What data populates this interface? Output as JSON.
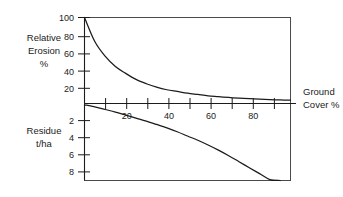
{
  "chart_data": {
    "type": "line",
    "title": "",
    "subtitle": "",
    "xlabel": "Ground Cover %",
    "xlim": [
      0,
      100
    ],
    "grid": false,
    "legend": "none",
    "x_ticks_major": [
      20,
      40,
      60,
      80
    ],
    "x_ticks_minor": [
      10,
      30,
      50,
      70,
      90
    ],
    "x_tick_labels": [
      "20",
      "40",
      "60",
      "80"
    ],
    "axes": [
      {
        "name": "relative-erosion",
        "label": "Relative Erosion %",
        "label_lines": [
          "Relative",
          "Erosion",
          "%"
        ],
        "position": "left-upper",
        "unit": "%",
        "ylim": [
          0,
          100
        ],
        "direction": "up-from-baseline",
        "ticks": [
          100,
          80,
          60,
          40,
          20
        ],
        "tick_labels": [
          "100",
          "80",
          "60",
          "40",
          "20"
        ]
      },
      {
        "name": "residue",
        "label": "Residue t/ha",
        "label_lines": [
          "Residue",
          "t/ha"
        ],
        "position": "left-lower",
        "unit": "t/ha",
        "ylim": [
          0,
          9
        ],
        "direction": "down-from-baseline",
        "ticks": [
          2,
          4,
          6,
          8
        ],
        "tick_labels": [
          "2",
          "4",
          "6",
          "8"
        ]
      }
    ],
    "series": [
      {
        "name": "Relative Erosion %",
        "axis": "relative-erosion",
        "x": [
          0,
          5,
          10,
          15,
          20,
          25,
          30,
          35,
          40,
          45,
          50,
          55,
          60,
          65,
          70,
          75,
          80,
          85,
          90,
          95,
          100
        ],
        "values": [
          100,
          72,
          55,
          43,
          35,
          28,
          23,
          19,
          16,
          14,
          12,
          10.5,
          9,
          8,
          7,
          6.2,
          5.6,
          5,
          4.5,
          4.1,
          3.8
        ]
      },
      {
        "name": "Residue t/ha",
        "axis": "residue",
        "x": [
          0,
          5,
          10,
          15,
          20,
          25,
          30,
          35,
          40,
          45,
          50,
          55,
          60,
          65,
          70,
          75,
          80,
          85,
          90,
          95,
          100
        ],
        "values": [
          0.15,
          0.4,
          0.7,
          1.0,
          1.35,
          1.7,
          2.05,
          2.45,
          2.85,
          3.3,
          3.8,
          4.3,
          4.85,
          5.45,
          6.1,
          6.8,
          7.5,
          8.2,
          8.9,
          9.5,
          10.1
        ]
      }
    ],
    "colors": {
      "curve": "#1b1b1b",
      "frame": "#4a4a4a",
      "axis": "#1b1b1b",
      "text": "#1b1b1b",
      "background": "#ffffff"
    }
  },
  "labels": {
    "relative_erosion_line1": "Relative",
    "relative_erosion_line2": "Erosion",
    "relative_erosion_line3": "%",
    "residue_line1": "Residue",
    "residue_line2": "t/ha",
    "ground_cover_line1": "Ground",
    "ground_cover_line2": "Cover %",
    "y_top_100": "100",
    "y_top_80": "80",
    "y_top_60": "60",
    "y_top_40": "40",
    "y_top_20": "20",
    "y_bot_2": "2",
    "y_bot_4": "4",
    "y_bot_6": "6",
    "y_bot_8": "8",
    "x_20": "20",
    "x_40": "40",
    "x_60": "60",
    "x_80": "80"
  }
}
